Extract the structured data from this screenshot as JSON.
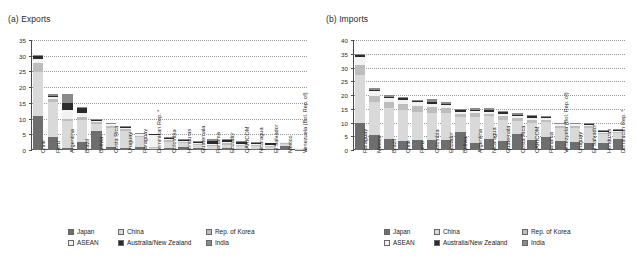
{
  "figure": {
    "panels": [
      {
        "id": "exports",
        "title": "(a) Exports",
        "legend_position": "bottom-center"
      },
      {
        "id": "imports",
        "title": "(b) Imports",
        "legend_position": "bottom-center"
      }
    ],
    "legend": {
      "items": [
        {
          "label": "Japan",
          "color": "#6e6e6e"
        },
        {
          "label": "China",
          "color": "#d9d9d9"
        },
        {
          "label": "Rep. of Korea",
          "color": "#bdbdbd"
        },
        {
          "label": "ASEAN",
          "color": "#f2f2f2"
        },
        {
          "label": "Australia/New Zealand",
          "color": "#2b2b2b"
        },
        {
          "label": "India",
          "color": "#8a8a8a"
        }
      ]
    }
  },
  "chart_data": [
    {
      "type": "bar",
      "stacked": true,
      "title": "(a) Exports",
      "xlabel": "",
      "ylabel": "",
      "ylim": [
        0,
        35
      ],
      "yticks": [
        0,
        5,
        10,
        15,
        20,
        25,
        30,
        35
      ],
      "grid": true,
      "legend": [
        "Japan",
        "China",
        "Rep. of Korea",
        "ASEAN",
        "Australia/New Zealand",
        "India"
      ],
      "categories": [
        "Chile",
        "Peru",
        "Argentina",
        "Brazil",
        "Bolivia",
        "Costa Rica",
        "Uruguay",
        "Paraguay",
        "Dominican Rep. *",
        "Colombia",
        "Honduras",
        "Guatemala",
        "Panama",
        "Ecuador",
        "CARICOM",
        "Nicaragua",
        "El Salvador",
        "Mexico",
        "Venezuela (Bol. Rep. of)"
      ],
      "series": [
        {
          "name": "Japan",
          "values": [
            10.9,
            4.2,
            0.5,
            2.6,
            6.1,
            0.9,
            0.7,
            1.0,
            0.2,
            0.6,
            1.0,
            0.5,
            0.3,
            0.5,
            0.3,
            0.3,
            0.3,
            1.2,
            0.1
          ]
        },
        {
          "name": "China",
          "values": [
            13.9,
            11.2,
            8.8,
            6.9,
            2.1,
            6.2,
            5.4,
            3.2,
            0.5,
            2.0,
            1.1,
            1.0,
            0.9,
            1.1,
            0.9,
            0.9,
            0.8,
            0.7,
            0.2
          ]
        },
        {
          "name": "Rep. of Korea",
          "values": [
            2.9,
            0.7,
            0.6,
            1.1,
            0.6,
            0.6,
            0.5,
            0.4,
            0.2,
            0.5,
            0.4,
            0.4,
            0.4,
            0.5,
            0.4,
            0.4,
            0.3,
            0.3,
            0.1
          ]
        },
        {
          "name": "ASEAN",
          "values": [
            1.3,
            0.7,
            2.8,
            1.3,
            0.6,
            0.5,
            0.4,
            0.4,
            4.0,
            0.4,
            0.5,
            0.4,
            0.4,
            0.4,
            0.4,
            0.3,
            0.3,
            0.2,
            0.1
          ]
        },
        {
          "name": "Australia/New Zealand",
          "values": [
            1.0,
            0.5,
            2.2,
            1.4,
            0.2,
            0.2,
            0.2,
            0.1,
            0.1,
            0.3,
            0.2,
            0.2,
            1.0,
            0.6,
            0.5,
            0.4,
            0.4,
            0.2,
            0.1
          ]
        },
        {
          "name": "India",
          "values": [
            0.3,
            0.4,
            2.9,
            0.5,
            0.3,
            0.2,
            0.4,
            0.3,
            0.1,
            0.3,
            0.4,
            0.4,
            0.4,
            0.3,
            0.3,
            0.2,
            0.2,
            0.1,
            0.1
          ]
        }
      ],
      "totals": [
        30.3,
        17.7,
        17.8,
        13.8,
        9.9,
        8.6,
        7.6,
        5.4,
        5.1,
        4.1,
        3.6,
        2.9,
        3.4,
        3.4,
        2.8,
        2.5,
        2.3,
        2.7,
        0.7
      ]
    },
    {
      "type": "bar",
      "stacked": true,
      "title": "(b) Imports",
      "xlabel": "",
      "ylabel": "",
      "ylim": [
        0,
        40
      ],
      "yticks": [
        0,
        5,
        10,
        15,
        20,
        25,
        30,
        35,
        40
      ],
      "grid": true,
      "legend": [
        "Japan",
        "China",
        "Rep. of Korea",
        "ASEAN",
        "Australia/New Zealand",
        "India"
      ],
      "categories": [
        "Paraguay",
        "Mexico",
        "Brazil",
        "Chile",
        "Peru",
        "Colombia",
        "Ecuador",
        "Bolivia",
        "Argentina",
        "Nicaragua",
        "Guatemala",
        "Costa Rica",
        "CARICOM",
        "Panama",
        "Venezuela (Bol. Rep. of)",
        "Uruguay",
        "El Salvador",
        "Honduras",
        "Dominican Rep. *"
      ],
      "series": [
        {
          "name": "Japan",
          "values": [
            9.8,
            5.5,
            4.1,
            3.2,
            3.6,
            3.5,
            3.6,
            6.5,
            2.5,
            4.1,
            3.4,
            5.7,
            3.8,
            4.6,
            3.2,
            2.9,
            2.6,
            2.7,
            4.0
          ]
        },
        {
          "name": "China",
          "values": [
            17.6,
            11.8,
            11.0,
            11.5,
            10.4,
            10.0,
            9.8,
            5.6,
            9.4,
            8.1,
            7.6,
            5.0,
            5.9,
            5.6,
            4.7,
            5.2,
            5.5,
            3.0,
            2.1
          ]
        },
        {
          "name": "Rep. of Korea",
          "values": [
            3.6,
            2.5,
            2.3,
            2.2,
            2.0,
            2.0,
            1.8,
            1.0,
            1.4,
            1.0,
            1.4,
            1.0,
            1.1,
            0.8,
            0.8,
            0.7,
            0.6,
            0.6,
            0.5
          ]
        },
        {
          "name": "ASEAN",
          "values": [
            2.8,
            1.8,
            1.5,
            1.4,
            1.3,
            1.2,
            1.0,
            0.9,
            1.0,
            0.8,
            0.8,
            0.7,
            1.0,
            0.6,
            0.6,
            0.5,
            0.5,
            0.4,
            0.4
          ]
        },
        {
          "name": "Australia/New Zealand",
          "values": [
            0.6,
            0.4,
            0.5,
            0.5,
            0.4,
            0.7,
            0.5,
            0.4,
            0.4,
            0.6,
            0.5,
            0.4,
            0.5,
            0.3,
            0.3,
            0.3,
            0.3,
            0.4,
            0.3
          ]
        },
        {
          "name": "India",
          "values": [
            0.6,
            0.4,
            0.6,
            0.4,
            0.6,
            1.1,
            0.9,
            0.6,
            0.5,
            0.6,
            0.6,
            0.5,
            0.4,
            0.4,
            0.4,
            0.4,
            0.4,
            0.3,
            0.3
          ]
        }
      ],
      "totals": [
        35.0,
        22.4,
        20.0,
        19.2,
        18.3,
        18.5,
        17.6,
        15.0,
        15.2,
        15.2,
        14.3,
        13.3,
        12.7,
        12.3,
        10.0,
        10.0,
        9.9,
        7.4,
        7.6
      ]
    }
  ]
}
